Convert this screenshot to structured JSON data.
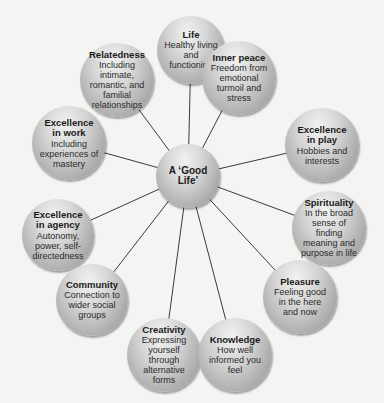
{
  "diagram": {
    "center": {
      "label": "A ‘Good Life’",
      "x": 188,
      "y": 176,
      "r": 32
    },
    "nodes": [
      {
        "id": "life",
        "title": "Life",
        "desc": "Healthy living and functioning",
        "x": 191,
        "y": 50,
        "r": 34
      },
      {
        "id": "relatedness",
        "title": "Relatedness",
        "desc": "Including intimate, romantic, and familial relationships",
        "x": 117,
        "y": 80,
        "r": 37
      },
      {
        "id": "inner-peace",
        "title": "Inner peace",
        "desc": "Freedom from emotional turmoil and stress",
        "x": 239,
        "y": 78,
        "r": 37
      },
      {
        "id": "excellence-work",
        "title": "Excellence in work",
        "desc": "Including experiences of mastery",
        "x": 69,
        "y": 143,
        "r": 37
      },
      {
        "id": "excellence-play",
        "title": "Excellence in play",
        "desc": "Hobbies and interests",
        "x": 322,
        "y": 145,
        "r": 37
      },
      {
        "id": "excellence-agency",
        "title": "Excellence in agency",
        "desc": "Autonomy, power, self-directedness",
        "x": 58,
        "y": 235,
        "r": 36
      },
      {
        "id": "spirituality",
        "title": "Spirituality",
        "desc": "In the broad sense of finding meaning and purpose in life",
        "x": 329,
        "y": 228,
        "r": 37
      },
      {
        "id": "community",
        "title": "Community",
        "desc": "Connection to wider social groups",
        "x": 92,
        "y": 300,
        "r": 36
      },
      {
        "id": "pleasure",
        "title": "Pleasure",
        "desc": "Feeling good in the here and now",
        "x": 300,
        "y": 297,
        "r": 37
      },
      {
        "id": "creativity",
        "title": "Creativity",
        "desc": "Expressing yourself through alternative forms",
        "x": 164,
        "y": 355,
        "r": 37
      },
      {
        "id": "knowledge",
        "title": "Knowledge",
        "desc": "How well informed you feel",
        "x": 235,
        "y": 355,
        "r": 37
      }
    ]
  }
}
